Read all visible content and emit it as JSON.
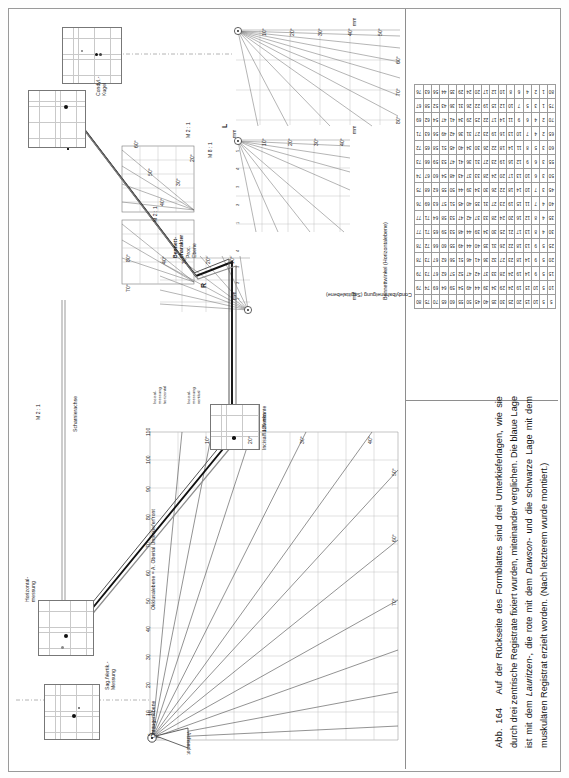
{
  "figure": {
    "number": "Abb. 164",
    "caption": "Auf der Rückseite des Formblattes sind drei Unterkieferlagen, wie sie durch drei zentrische Registrate fixiert wurden, miteinander verglichen. Die blaue Lage ist mit dem Lauritzen-, die rote mit dem Dawson- und die schwarze Lage mit dem muskulären Registrat erzielt worden. (Nach letzterem wurde montiert.)",
    "caption_italic_terms": [
      "Lauritzen",
      "Dawson"
    ]
  },
  "panels": {
    "condyl_upper_left": {
      "label": "Condyl.-\nKugel",
      "label_line1": "Condyl.-",
      "label_line2": "Kugel",
      "unit": "mm"
    },
    "condyl_upper_right": {
      "label_line1": "Condyl.-",
      "label_line2": "Kugel",
      "unit": "mm"
    },
    "condyl_lower": {
      "label_line1": "Condyl.-",
      "label_line2": "Kugel",
      "axis_label": "Achsenlot"
    },
    "side_right": "R",
    "side_left": "L",
    "scale_m21_upper": "M 2 : 1",
    "scale_m81": "M 8 : 1",
    "scale_m21_lower": "M 2 : 1",
    "bennett_char": {
      "line1": "Bennett-",
      "line2": "charakter",
      "line3": "Proc.",
      "line4": "Ebene"
    },
    "hinge_axis": "Scharnierachse",
    "measure_horizontal": {
      "line1": "Horizontal-",
      "line2": "messung"
    },
    "measure_sagvert": {
      "line1": "Sag./Vertik.-",
      "line2": "Messung"
    },
    "incisal_edge": "Incisalflächenkante",
    "occlusal_plane": "Okklusalebene = A. Oberial Unterkieferfront",
    "ear_eye_plane": "Ohraugenebene",
    "incisal_meas_left": {
      "line1": "Incisal-",
      "line2": "messung",
      "line3": "horizontal"
    },
    "incisal_meas_right": {
      "line1": "Incisal-",
      "line2": "messung",
      "line3": "vertikal"
    },
    "mm_unit": "mm",
    "mm120": "120 mm"
  },
  "axes": {
    "degree_ticks_fan": [
      "10°",
      "20°",
      "30°",
      "40°",
      "50°",
      "60°",
      "70°",
      "80°"
    ],
    "mm_ticks_small": [
      "1",
      "2",
      "3",
      "4",
      "5"
    ],
    "mm_ticks_mid": [
      "1",
      "2",
      "3",
      "4",
      "5",
      "6",
      "7",
      "8",
      "9",
      "10"
    ],
    "mm_ticks_long": [
      "10",
      "20",
      "30",
      "40",
      "50",
      "60",
      "70",
      "80",
      "90",
      "100",
      "110",
      "120"
    ],
    "fan_deg_lower": [
      "10°",
      "20°",
      "30°",
      "40°",
      "50°",
      "60°",
      "70°"
    ],
    "vert_ticks_lower": [
      "5",
      "10",
      "20",
      "30",
      "40",
      "50"
    ]
  },
  "chart_data": {
    "type": "table",
    "xlabel": "Bennettwinkel (Horizontalebene)",
    "ylabel": "Condylbahnneigung (Sagittalebene)",
    "col_headers": [
      "5",
      "10",
      "15",
      "20",
      "25",
      "30",
      "35",
      "40",
      "45",
      "50",
      "55",
      "60",
      "65",
      "70",
      "75",
      "80"
    ],
    "row_headers": [
      "5",
      "10",
      "15",
      "20",
      "25",
      "30",
      "35",
      "40",
      "45",
      "50",
      "55",
      "60",
      "65",
      "70",
      "75",
      "80"
    ],
    "rows": [
      [
        "5",
        "10",
        "15",
        "20",
        "25",
        "30",
        "35",
        "40",
        "45",
        "50",
        "55",
        "60",
        "65",
        "70",
        "75",
        "80"
      ],
      [
        "5",
        "10",
        "15",
        "19",
        "24",
        "29",
        "34",
        "39",
        "44",
        "49",
        "54",
        "59",
        "64",
        "69",
        "74",
        "79"
      ],
      [
        "5",
        "9",
        "14",
        "19",
        "24",
        "28",
        "33",
        "37",
        "42",
        "47",
        "52",
        "57",
        "62",
        "67",
        "73",
        "79"
      ],
      [
        "5",
        "9",
        "14",
        "18",
        "23",
        "27",
        "32",
        "36",
        "41",
        "46",
        "51",
        "56",
        "62",
        "67",
        "73",
        "78"
      ],
      [
        "5",
        "9",
        "13",
        "18",
        "22",
        "26",
        "31",
        "35",
        "40",
        "44",
        "49",
        "55",
        "60",
        "66",
        "72",
        "78"
      ],
      [
        "4",
        "8",
        "13",
        "17",
        "21",
        "25",
        "30",
        "34",
        "39",
        "44",
        "48",
        "53",
        "59",
        "65",
        "71",
        "77"
      ],
      [
        "4",
        "8",
        "12",
        "16",
        "20",
        "24",
        "28",
        "33",
        "37",
        "42",
        "47",
        "53",
        "58",
        "64",
        "71",
        "77"
      ],
      [
        "4",
        "7",
        "11",
        "15",
        "19",
        "23",
        "27",
        "31",
        "35",
        "40",
        "45",
        "51",
        "57",
        "63",
        "69",
        "76"
      ],
      [
        "3",
        "7",
        "10",
        "14",
        "18",
        "22",
        "26",
        "30",
        "34",
        "39",
        "44",
        "50",
        "55",
        "62",
        "68",
        "75"
      ],
      [
        "3",
        "6",
        "10",
        "13",
        "17",
        "20",
        "24",
        "28",
        "33",
        "37",
        "43",
        "48",
        "54",
        "60",
        "67",
        "74"
      ],
      [
        "3",
        "6",
        "9",
        "12",
        "16",
        "19",
        "23",
        "27",
        "31",
        "36",
        "41",
        "47",
        "53",
        "59",
        "66",
        "73"
      ],
      [
        "3",
        "5",
        "8",
        "11",
        "14",
        "18",
        "22",
        "26",
        "30",
        "34",
        "40",
        "45",
        "51",
        "58",
        "65",
        "72"
      ],
      [
        "2",
        "4",
        "7",
        "10",
        "13",
        "16",
        "19",
        "23",
        "27",
        "31",
        "36",
        "42",
        "49",
        "56",
        "63",
        "71"
      ],
      [
        "2",
        "4",
        "6",
        "9",
        "11",
        "14",
        "17",
        "22",
        "25",
        "29",
        "34",
        "41",
        "47",
        "54",
        "62",
        "69"
      ],
      [
        "1",
        "3",
        "5",
        "7",
        "10",
        "12",
        "15",
        "19",
        "22",
        "26",
        "31",
        "36",
        "43",
        "52",
        "58",
        "67"
      ],
      [
        "1",
        "2",
        "4",
        "6",
        "8",
        "10",
        "12",
        "17",
        "20",
        "24",
        "29",
        "35",
        "44",
        "56",
        "63",
        "76"
      ]
    ]
  },
  "colors": {
    "tracer_black": "#111111",
    "tracer_blue": "#8d8d8d",
    "tracer_red": "#555555",
    "grid": "#c2c2c2",
    "frame": "#9a9a9a"
  }
}
